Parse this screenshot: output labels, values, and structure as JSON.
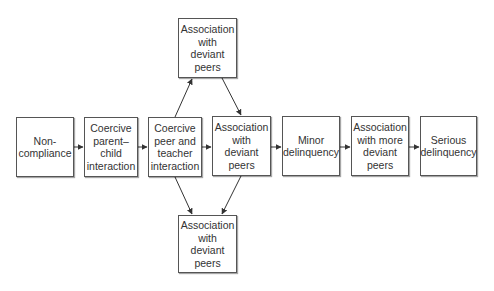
{
  "diagram": {
    "type": "flowchart",
    "nodes": [
      {
        "id": "noncompliance",
        "label": "Non-\ncompliance"
      },
      {
        "id": "coercive-parent-child",
        "label": "Coercive\nparent–\nchild\ninteraction"
      },
      {
        "id": "coercive-peer-teacher",
        "label": "Coercive\npeer and\nteacher\ninteraction"
      },
      {
        "id": "assoc-deviant-peers-top",
        "label": "Association\nwith\ndeviant\npeers"
      },
      {
        "id": "assoc-deviant-peers-mid",
        "label": "Association\nwith deviant\npeers"
      },
      {
        "id": "assoc-deviant-peers-bottom",
        "label": "Association\nwith\ndeviant\npeers"
      },
      {
        "id": "minor-delinquency",
        "label": "Minor\ndelinquency"
      },
      {
        "id": "assoc-more-deviant-peers",
        "label": "Association\nwith more\ndeviant\npeers"
      },
      {
        "id": "serious-delinquency",
        "label": "Serious\ndelinquency"
      }
    ],
    "edges": [
      {
        "from": "noncompliance",
        "to": "coercive-parent-child"
      },
      {
        "from": "coercive-parent-child",
        "to": "coercive-peer-teacher"
      },
      {
        "from": "coercive-peer-teacher",
        "to": "assoc-deviant-peers-mid"
      },
      {
        "from": "coercive-peer-teacher",
        "to": "assoc-deviant-peers-top"
      },
      {
        "from": "coercive-peer-teacher",
        "to": "assoc-deviant-peers-bottom"
      },
      {
        "from": "assoc-deviant-peers-top",
        "to": "assoc-deviant-peers-mid"
      },
      {
        "from": "assoc-deviant-peers-mid",
        "to": "assoc-deviant-peers-bottom"
      },
      {
        "from": "assoc-deviant-peers-mid",
        "to": "minor-delinquency"
      },
      {
        "from": "minor-delinquency",
        "to": "assoc-more-deviant-peers"
      },
      {
        "from": "assoc-more-deviant-peers",
        "to": "serious-delinquency"
      }
    ]
  },
  "colors": {
    "border": "#555555",
    "text": "#333333",
    "arrow": "#333333",
    "background": "#ffffff"
  }
}
